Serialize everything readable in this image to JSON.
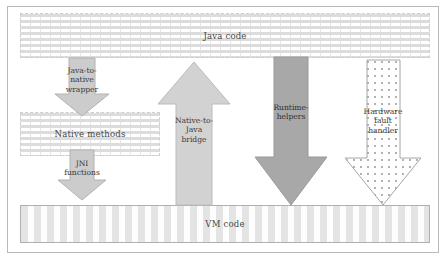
{
  "diagram": {
    "layers": [
      {
        "id": "java-code",
        "label": "Java code",
        "fill_pattern": "vertical-dash-hatch",
        "border_color": "#cfcfcf"
      },
      {
        "id": "native-methods",
        "label": "Native methods",
        "fill_pattern": "vertical-dash-hatch",
        "border_color": "#cfcfcf"
      },
      {
        "id": "vm-code",
        "label": "VM code",
        "fill_pattern": "horizontal-dash-hatch",
        "border_color": "#b0b0b0"
      }
    ],
    "arrows": [
      {
        "id": "java-to-native-wrapper",
        "lines": [
          "Java-to-",
          "native",
          "wrapper"
        ],
        "direction": "down",
        "fill": "#cccccc",
        "stroke": "#b2b2b2",
        "from": "java-code",
        "to": "native-methods"
      },
      {
        "id": "jni-functions",
        "lines": [
          "JNI",
          "functions"
        ],
        "direction": "down",
        "fill": "#cccccc",
        "stroke": "#b2b2b2",
        "from": "native-methods",
        "to": "vm-code"
      },
      {
        "id": "native-to-java-bridge",
        "lines": [
          "Native-to-",
          "Java",
          "bridge"
        ],
        "direction": "up",
        "fill": "#d2d2d2",
        "stroke": "#bcbcbc",
        "from": "vm-code",
        "to": "java-code"
      },
      {
        "id": "runtime-helpers",
        "lines": [
          "Runtime-",
          "helpers"
        ],
        "direction": "down",
        "fill": "#a8a8a8",
        "stroke": "#9a9a9a",
        "from": "java-code",
        "to": "vm-code"
      },
      {
        "id": "hardware-fault-handler",
        "lines": [
          "Hardware",
          "fault",
          "handler"
        ],
        "direction": "down",
        "fill": "dotted",
        "stroke": "#a6a6a6",
        "from": "java-code",
        "to": "vm-code"
      }
    ]
  }
}
